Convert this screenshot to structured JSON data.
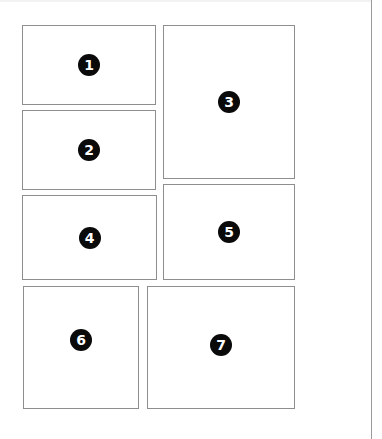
{
  "panels": [
    {
      "label": "1",
      "x": 22,
      "y": 25,
      "w": 134,
      "h": 80
    },
    {
      "label": "2",
      "x": 22,
      "y": 110,
      "w": 134,
      "h": 80
    },
    {
      "label": "3",
      "x": 163,
      "y": 25,
      "w": 132,
      "h": 154
    },
    {
      "label": "4",
      "x": 22,
      "y": 195,
      "w": 135,
      "h": 85
    },
    {
      "label": "5",
      "x": 163,
      "y": 184,
      "w": 132,
      "h": 96
    },
    {
      "label": "6",
      "x": 23,
      "y": 286,
      "w": 116,
      "h": 123
    },
    {
      "label": "7",
      "x": 147,
      "y": 286,
      "w": 148,
      "h": 123
    }
  ],
  "caption": "",
  "colors": {
    "border": "#8e8e8e",
    "badge": "#0a0a0a",
    "badge_text": "#ffffff"
  }
}
